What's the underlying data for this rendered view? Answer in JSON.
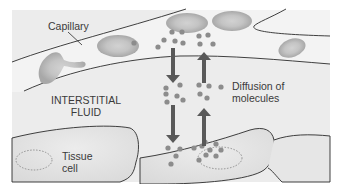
{
  "labels": {
    "capillary": "Capillary",
    "interstitial_line1": "INTERSTITIAL",
    "interstitial_line2": "FLUID",
    "diffusion_line1": "Diffusion of",
    "diffusion_line2": "molecules",
    "tissue_line1": "Tissue",
    "tissue_line2": "cell"
  },
  "colors": {
    "background": "#ededed",
    "capillary_lumen": "#f4f4f4",
    "fluid": "#ebebeb",
    "cell": "#e2e2e2",
    "rbc": "#b5b5b5",
    "molecule": "#8c8c8c",
    "arrow": "#5a5a5a",
    "line": "#2a2a2a"
  },
  "arrows": [
    {
      "direction": "down",
      "from": "capillary",
      "to": "interstitial-fluid"
    },
    {
      "direction": "up",
      "from": "interstitial-fluid",
      "to": "capillary"
    },
    {
      "direction": "down",
      "from": "interstitial-fluid",
      "to": "tissue-cell"
    },
    {
      "direction": "up",
      "from": "tissue-cell",
      "to": "interstitial-fluid"
    }
  ]
}
